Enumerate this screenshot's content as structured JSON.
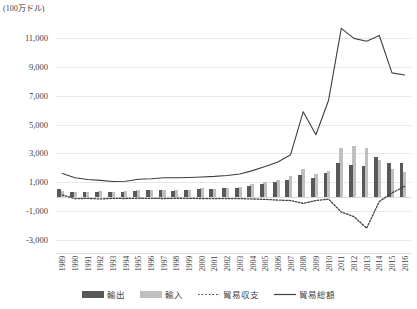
{
  "unit_caption": "(100万ドル)",
  "chart_data": {
    "type": "bar",
    "title": "",
    "subtitle": "",
    "xlabel": "",
    "ylabel": "(100万ドル)",
    "unit": "100万ドル",
    "grid": true,
    "legend_position": "bottom",
    "ylim": [
      -4000,
      12000
    ],
    "yticks": [
      11000,
      9000,
      7000,
      5000,
      3000,
      1000,
      -1000,
      -3000
    ],
    "ytick_labels": [
      "11,000",
      "9,000",
      "7,000",
      "5,000",
      "3,000",
      "1,000",
      "-1,000",
      "-3,000"
    ],
    "categories": [
      "1989",
      "1990",
      "1991",
      "1992",
      "1993",
      "1994",
      "1995",
      "1996",
      "1997",
      "1998",
      "1999",
      "2000",
      "2001",
      "2002",
      "2003",
      "2004",
      "2005",
      "2006",
      "2007",
      "2008",
      "2009",
      "2010",
      "2011",
      "2012",
      "2013",
      "2014",
      "2015",
      "2016"
    ],
    "series": [
      {
        "name": "輸出",
        "type": "bar",
        "color": "#585858",
        "values": [
          520,
          330,
          330,
          350,
          300,
          330,
          390,
          430,
          450,
          420,
          450,
          520,
          500,
          560,
          620,
          760,
          880,
          1000,
          1180,
          1530,
          1300,
          1640,
          2340,
          2160,
          2150,
          2720,
          2300,
          2360
        ]
      },
      {
        "name": "輸入",
        "type": "bar",
        "color": "#bfbfbf",
        "values": [
          420,
          330,
          350,
          400,
          350,
          380,
          430,
          470,
          490,
          440,
          470,
          560,
          550,
          600,
          690,
          840,
          1000,
          1130,
          1400,
          1900,
          1580,
          1800,
          3400,
          3500,
          3380,
          2550,
          1950,
          1700
        ]
      },
      {
        "name": "貿易収支",
        "type": "line",
        "style": "dotted",
        "color": "#404040",
        "values": [
          100,
          -150,
          -130,
          -170,
          -130,
          -140,
          -120,
          -130,
          -140,
          -120,
          -130,
          -140,
          -150,
          -140,
          -150,
          -170,
          -200,
          -250,
          -280,
          -480,
          -280,
          -180,
          -1080,
          -1400,
          -2200,
          -350,
          250,
          700
        ]
      },
      {
        "name": "貿易総額",
        "type": "line",
        "style": "solid",
        "color": "#3f3f3f",
        "values": [
          1600,
          1300,
          1180,
          1120,
          1040,
          1060,
          1200,
          1230,
          1300,
          1300,
          1320,
          1360,
          1400,
          1460,
          1560,
          1800,
          2080,
          2400,
          2900,
          5900,
          4300,
          6700,
          11700,
          11000,
          10800,
          11200,
          8600,
          8450
        ]
      }
    ]
  },
  "legend": {
    "items": [
      {
        "label": "輸出",
        "swatch": "bar-dark",
        "color": "#585858"
      },
      {
        "label": "輸入",
        "swatch": "bar-light",
        "color": "#bfbfbf"
      },
      {
        "label": "貿易収支",
        "swatch": "line-dotted",
        "color": "#404040"
      },
      {
        "label": "貿易総額",
        "swatch": "line-solid",
        "color": "#3f3f3f"
      }
    ]
  }
}
